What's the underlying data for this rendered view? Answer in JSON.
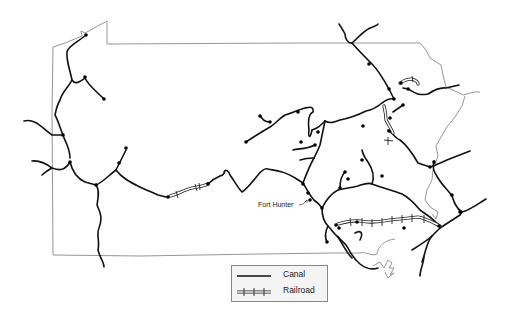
{
  "map": {
    "subject": "Pennsylvania canal and railroad network",
    "labels": [
      {
        "id": "fort-hunter",
        "text": "Fort Hunter"
      }
    ]
  },
  "legend": {
    "items": [
      {
        "key": "canal",
        "label": "Canal",
        "symbol": "solid-line"
      },
      {
        "key": "railroad",
        "label": "Railroad",
        "symbol": "cross-hatched-line"
      }
    ]
  },
  "colors": {
    "background": "#ffffff",
    "canal": "#111111",
    "railroad": "#222222",
    "state_border": "#8a8a8a",
    "legend_background": "#f4f4f4",
    "legend_border": "#888888"
  }
}
